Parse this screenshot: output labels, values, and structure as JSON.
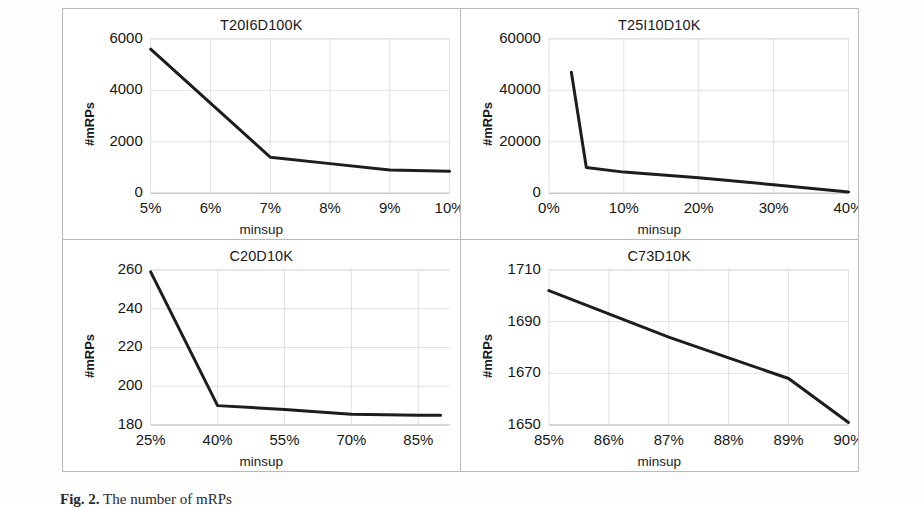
{
  "figure": {
    "caption_number": "Fig. 2.",
    "caption_text": "The number of mRPs"
  },
  "chart_data": [
    {
      "id": "t20i6d100k",
      "type": "line",
      "title": "T20I6D100K",
      "xlabel": "minsup",
      "ylabel": "#mRPs",
      "x": [
        5,
        6,
        7,
        8,
        9,
        10
      ],
      "values": [
        5600,
        3500,
        1400,
        1150,
        900,
        850
      ],
      "xticklabels": [
        "5%",
        "6%",
        "7%",
        "8%",
        "9%",
        "10%"
      ],
      "yticklabels": [
        "0",
        "2000",
        "4000",
        "6000"
      ],
      "yticks": [
        0,
        2000,
        4000,
        6000
      ],
      "xlim": [
        5,
        10
      ],
      "ylim": [
        0,
        6000
      ],
      "grid": true,
      "legend": "none",
      "line_color": "#1d1d1d"
    },
    {
      "id": "t25i10d10k",
      "type": "line",
      "title": "T25I10D10K",
      "xlabel": "minsup",
      "ylabel": "#mRPs",
      "x": [
        3,
        5,
        10,
        20,
        30,
        40
      ],
      "values": [
        47000,
        10000,
        8200,
        6000,
        3300,
        500
      ],
      "xticklabels": [
        "0%",
        "10%",
        "20%",
        "30%",
        "40%"
      ],
      "yticklabels": [
        "0",
        "20000",
        "40000",
        "60000"
      ],
      "yticks": [
        0,
        20000,
        40000,
        60000
      ],
      "xlim": [
        0,
        40
      ],
      "ylim": [
        0,
        60000
      ],
      "grid": true,
      "legend": "none",
      "line_color": "#1d1d1d"
    },
    {
      "id": "c20d10k",
      "type": "line",
      "title": "C20D10K",
      "xlabel": "minsup",
      "ylabel": "#mRPs",
      "x": [
        25,
        40,
        55,
        70,
        85,
        90
      ],
      "values": [
        259,
        190,
        188,
        185.5,
        185,
        185
      ],
      "xticklabels": [
        "25%",
        "40%",
        "55%",
        "70%",
        "85%"
      ],
      "yticklabels": [
        "180",
        "200",
        "220",
        "240",
        "260"
      ],
      "yticks": [
        180,
        200,
        220,
        240,
        260
      ],
      "xlim": [
        25,
        92
      ],
      "ylim": [
        180,
        260
      ],
      "grid": true,
      "legend": "none",
      "line_color": "#1d1d1d"
    },
    {
      "id": "c73d10k",
      "type": "line",
      "title": "C73D10K",
      "xlabel": "minsup",
      "ylabel": "#mRPs",
      "x": [
        85,
        86,
        87,
        88,
        89,
        90
      ],
      "values": [
        1702,
        1693,
        1684,
        1676,
        1668,
        1651
      ],
      "xticklabels": [
        "85%",
        "86%",
        "87%",
        "88%",
        "89%",
        "90%"
      ],
      "yticklabels": [
        "1650",
        "1670",
        "1690",
        "1710"
      ],
      "yticks": [
        1650,
        1670,
        1690,
        1710
      ],
      "xlim": [
        85,
        90
      ],
      "ylim": [
        1650,
        1710
      ],
      "grid": true,
      "legend": "none",
      "line_color": "#1d1d1d"
    }
  ]
}
